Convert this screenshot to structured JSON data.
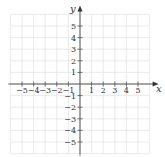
{
  "chart_data": {
    "type": "diagram",
    "title": "",
    "xlabel": "x",
    "ylabel": "y",
    "xlim": [
      -6,
      6
    ],
    "ylim": [
      -6,
      6
    ],
    "grid": true,
    "x_ticks": [
      -5,
      -4,
      -3,
      -2,
      -1,
      1,
      2,
      3,
      4,
      5
    ],
    "y_ticks": [
      5,
      4,
      3,
      2,
      1,
      -1,
      -2,
      -3,
      -4,
      -5
    ],
    "x_tick_labels": [
      "−5",
      "−4",
      "−3",
      "−2",
      "−1",
      "1",
      "2",
      "3",
      "4",
      "5"
    ],
    "y_tick_labels": [
      "5",
      "4",
      "3",
      "2",
      "1",
      "−1",
      "−2",
      "−3",
      "−4",
      "−5"
    ]
  },
  "axes": {
    "x_label": "x",
    "y_label": "y"
  },
  "colors": {
    "grid": "#e4e4e4",
    "axis": "#555555"
  }
}
